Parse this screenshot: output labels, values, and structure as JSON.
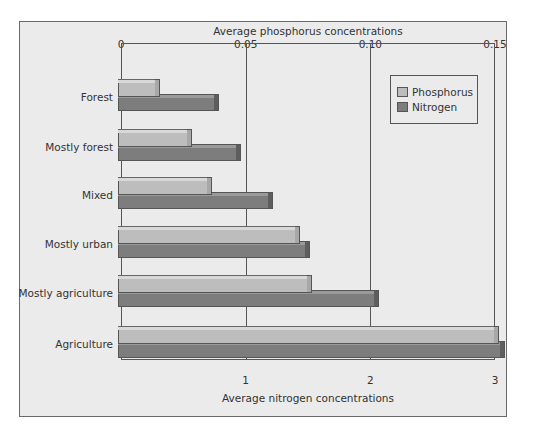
{
  "chart_data": {
    "type": "bar",
    "orientation": "horizontal",
    "title": "",
    "top_axis_label": "Average phosphorus concentrations",
    "bottom_axis_label": "Average nitrogen concentrations",
    "top_ticks": [
      "0",
      "0.05",
      "0.10",
      "0.15"
    ],
    "bottom_ticks": [
      "1",
      "2",
      "3"
    ],
    "top_range": [
      0,
      0.15
    ],
    "bottom_range": [
      0,
      3
    ],
    "grid": true,
    "legend_position": "upper right",
    "categories": [
      "Forest",
      "Mostly forest",
      "Mixed",
      "Mostly urban",
      "Mostly agriculture",
      "Agriculture"
    ],
    "series": [
      {
        "name": "Phosphorus",
        "axis": "top",
        "color": "#bdbdbd",
        "values": [
          0.014,
          0.027,
          0.035,
          0.07,
          0.075,
          0.15
        ]
      },
      {
        "name": "Nitrogen",
        "axis": "bottom",
        "color": "#7d7d7d",
        "values": [
          0.75,
          0.93,
          1.19,
          1.48,
          2.04,
          3.05
        ]
      }
    ]
  },
  "legend": {
    "items": [
      "Phosphorus",
      "Nitrogen"
    ]
  }
}
